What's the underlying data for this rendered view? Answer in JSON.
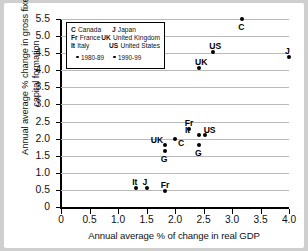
{
  "chart_data": {
    "type": "scatter",
    "title": "",
    "xlabel": "Annual average % of change in real GDP",
    "ylabel": "Annual average % change in gross fixed capital formation",
    "xlim": [
      0,
      4.0
    ],
    "ylim": [
      0,
      5.5
    ],
    "xticks": [
      "0",
      "0.5",
      "1.0",
      "1.5",
      "2.0",
      "2.5",
      "3.0",
      "3.5",
      "4.0"
    ],
    "yticks": [
      "0",
      "0.5",
      "1.0",
      "1.5",
      "2.0",
      "2.5",
      "3.0",
      "3.5",
      "4.0",
      "4.5",
      "5.0",
      "5.5"
    ],
    "grid": true,
    "legend_position": "upper-left-inset",
    "series": [
      {
        "name": "1980-89",
        "points": [
          {
            "label": "C",
            "x": 3.18,
            "y": 5.5,
            "label_pos": "below"
          },
          {
            "label": "US",
            "x": 2.67,
            "y": 4.52,
            "label_pos": "above"
          },
          {
            "label": "J",
            "x": 4.0,
            "y": 4.4,
            "label_pos": "above"
          },
          {
            "label": "UK",
            "x": 2.42,
            "y": 4.07,
            "label_pos": "above"
          }
        ]
      },
      {
        "name": "1990-99",
        "points": [
          {
            "label": "Fr",
            "x": 2.24,
            "y": 2.27,
            "label_pos": "above"
          },
          {
            "label": "US",
            "x": 2.52,
            "y": 2.12,
            "label_pos": "above-right"
          },
          {
            "label": "It",
            "x": 2.42,
            "y": 2.1,
            "label_pos": "above-left"
          },
          {
            "label": "C",
            "x": 2.0,
            "y": 2.0,
            "label_pos": "below-right"
          },
          {
            "label": "UK",
            "x": 1.82,
            "y": 1.8,
            "label_pos": "above-left"
          },
          {
            "label": "G",
            "x": 2.42,
            "y": 1.8,
            "label_pos": "below"
          },
          {
            "label": "G",
            "x": 1.82,
            "y": 1.63,
            "label_pos": "below"
          },
          {
            "label": "It",
            "x": 1.32,
            "y": 0.57,
            "label_pos": "above"
          },
          {
            "label": "J",
            "x": 1.5,
            "y": 0.57,
            "label_pos": "above"
          },
          {
            "label": "Fr",
            "x": 1.82,
            "y": 0.47,
            "label_pos": "above"
          }
        ]
      }
    ],
    "legend": {
      "countries": [
        {
          "abbr": "C",
          "name": "Canada",
          "abbr2": "J",
          "name2": "Japan"
        },
        {
          "abbr": "Fr",
          "name": "France",
          "abbr2": "UK",
          "name2": "United Kingdom"
        },
        {
          "abbr": "It",
          "name": "Italy",
          "abbr2": "US",
          "name2": "United States"
        }
      ],
      "periods": [
        "1980-89",
        "1990-99"
      ]
    }
  }
}
